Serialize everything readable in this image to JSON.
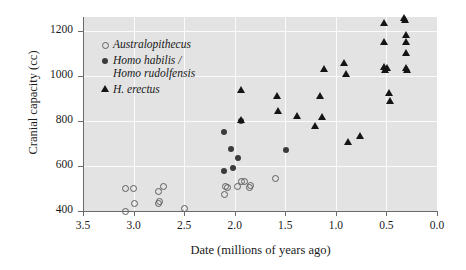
{
  "chart_data": {
    "type": "scatter",
    "title": "",
    "xlabel": "Date (millions of years ago)",
    "ylabel": "Cranial capacity (cc)",
    "xlim": [
      3.5,
      0.0
    ],
    "ylim": [
      400,
      1260
    ],
    "x_inverted": true,
    "xticks": [
      "3.5",
      "3.0",
      "2.5",
      "2.0",
      "1.5",
      "1.0",
      "0.5",
      "0.0"
    ],
    "xtick_values": [
      3.5,
      3.0,
      2.5,
      2.0,
      1.5,
      1.0,
      0.5,
      0.0
    ],
    "yticks": [
      "400",
      "600",
      "800",
      "1000",
      "1200"
    ],
    "ytick_values": [
      400,
      600,
      800,
      1000,
      1200
    ],
    "grid": "both",
    "legend_position": "upper-left-inside",
    "plot_background": "#e3e3e3",
    "gridline_color": "#fbfbfb",
    "axis_color": "#6a6a6a",
    "series": [
      {
        "name": "Australopithecus",
        "marker": "open-circle",
        "color": "#5d5d5d",
        "points": [
          [
            3.08,
            400
          ],
          [
            3.08,
            500
          ],
          [
            3.0,
            500
          ],
          [
            2.99,
            435
          ],
          [
            2.75,
            485
          ],
          [
            2.75,
            433
          ],
          [
            2.74,
            443
          ],
          [
            2.7,
            510
          ],
          [
            2.5,
            412
          ],
          [
            2.1,
            475
          ],
          [
            2.09,
            508
          ],
          [
            2.07,
            505
          ],
          [
            1.97,
            508
          ],
          [
            1.93,
            530
          ],
          [
            1.9,
            530
          ],
          [
            1.85,
            505
          ],
          [
            1.84,
            512
          ],
          [
            1.6,
            542
          ]
        ]
      },
      {
        "name": "Homo habilis / Homo rudolfensis",
        "marker": "filled-circle",
        "color": "#3b3b3b",
        "points": [
          [
            2.11,
            748
          ],
          [
            2.11,
            578
          ],
          [
            2.04,
            675
          ],
          [
            2.02,
            592
          ],
          [
            1.97,
            637
          ],
          [
            1.94,
            800
          ],
          [
            1.49,
            672
          ]
        ]
      },
      {
        "name": "H. erectus",
        "marker": "filled-triangle",
        "color": "#151515",
        "points": [
          [
            1.94,
            935
          ],
          [
            1.94,
            800
          ],
          [
            1.58,
            905
          ],
          [
            1.57,
            840
          ],
          [
            1.38,
            820
          ],
          [
            1.2,
            775
          ],
          [
            1.15,
            905
          ],
          [
            1.14,
            812
          ],
          [
            1.12,
            1025
          ],
          [
            0.92,
            1052
          ],
          [
            0.9,
            1005
          ],
          [
            0.88,
            705
          ],
          [
            0.76,
            728
          ],
          [
            0.52,
            1232
          ],
          [
            0.52,
            1145
          ],
          [
            0.52,
            1035
          ],
          [
            0.51,
            1022
          ],
          [
            0.49,
            1030
          ],
          [
            0.47,
            920
          ],
          [
            0.46,
            885
          ],
          [
            0.32,
            1255
          ],
          [
            0.31,
            1242
          ],
          [
            0.3,
            1178
          ],
          [
            0.3,
            1145
          ],
          [
            0.3,
            1098
          ],
          [
            0.3,
            1030
          ],
          [
            0.29,
            1022
          ]
        ]
      }
    ]
  },
  "legend": {
    "items": [
      {
        "marker": "open-circle",
        "line1": "Australopithecus",
        "line2": ""
      },
      {
        "marker": "filled-circle",
        "line1": "Homo habilis /",
        "line2": "Homo rudolfensis"
      },
      {
        "marker": "filled-triangle",
        "line1": "H. erectus",
        "line2": ""
      }
    ]
  }
}
